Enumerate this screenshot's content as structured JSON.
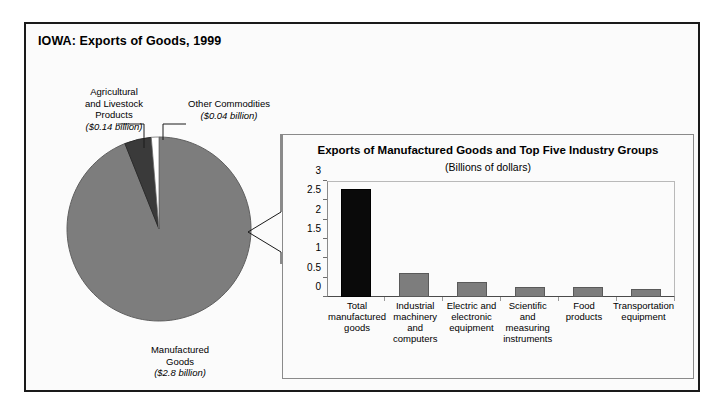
{
  "figure": {
    "title": "IOWA: Exports of Goods, 1999"
  },
  "pie": {
    "labels": {
      "agricultural": "Agricultural\nand Livestock\nProducts",
      "agricultural_value": "($0.14 billion)",
      "other": "Other Commodities",
      "other_value": "($0.04 billion)",
      "manufactured": "Manufactured\nGoods",
      "manufactured_value": "($2.8 billion)"
    }
  },
  "inset": {
    "title": "Exports of Manufactured Goods and Top Five Industry Groups",
    "subtitle": "(Billions of dollars)"
  },
  "colors": {
    "manufactured_slice": "#7d7d7d",
    "agricultural_slice": "#3a3a3a",
    "other_slice": "#ffffff",
    "bar_gray": "#7d7d7d",
    "bar_highlight": "#0a0a0a",
    "frame": "#1a1a1a"
  },
  "chart_data": [
    {
      "type": "pie",
      "title": "IOWA: Exports of Goods, 1999",
      "unit": "billions of dollars",
      "labels": [
        "Manufactured Goods",
        "Agricultural and Livestock Products",
        "Other Commodities"
      ],
      "values": [
        2.8,
        0.14,
        0.04
      ],
      "value_labels": [
        "($2.8 billion)",
        "($0.14 billion)",
        "($0.04 billion)"
      ],
      "colors": [
        "#7d7d7d",
        "#3a3a3a",
        "#ffffff"
      ],
      "legend": "none"
    },
    {
      "type": "bar",
      "title": "Exports of Manufactured Goods and Top Five Industry Groups",
      "subtitle": "(Billions of dollars)",
      "categories": [
        "Total manufactured goods",
        "Industrial machinery and computers",
        "Electric and electronic equipment",
        "Scientific and measuring instruments",
        "Food products",
        "Transportation equipment"
      ],
      "values": [
        2.8,
        0.63,
        0.39,
        0.27,
        0.25,
        0.22
      ],
      "xlabel": "",
      "ylabel": "",
      "ylim": [
        0,
        3
      ],
      "yticks": [
        0,
        0.5,
        1,
        1.5,
        2,
        2.5,
        3
      ],
      "ytick_labels": [
        "0",
        "0.5",
        "1",
        "1.5",
        "2",
        "2.5",
        "3"
      ],
      "grid": false,
      "legend": "none",
      "bar_colors": [
        "#0a0a0a",
        "#7d7d7d",
        "#7d7d7d",
        "#7d7d7d",
        "#7d7d7d",
        "#7d7d7d"
      ]
    }
  ]
}
